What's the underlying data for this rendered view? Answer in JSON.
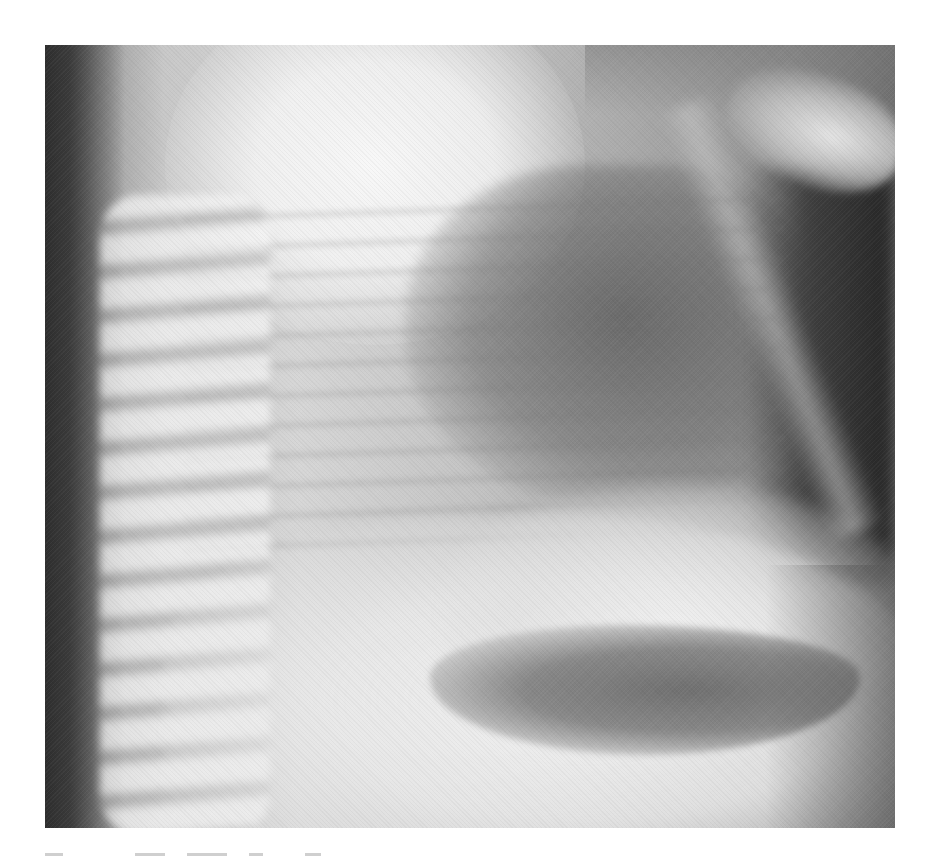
{
  "figure": {
    "type": "radiograph",
    "regions": [
      {
        "name": "spine",
        "tone": "light"
      },
      {
        "name": "lung-field",
        "tone": "dark"
      },
      {
        "name": "shoulder-bone",
        "tone": "light"
      },
      {
        "name": "gastric-air-bubble",
        "tone": "dark"
      },
      {
        "name": "liver-shadow",
        "tone": "light"
      }
    ],
    "colors": {
      "background": "#ffffff",
      "darkest": "#2e2e2e",
      "mid": "#8a8a8a",
      "lightest": "#f5f5f5"
    }
  },
  "caption": {
    "text": "",
    "visible_fragments": 5
  }
}
